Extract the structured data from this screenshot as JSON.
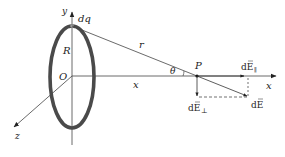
{
  "figure": {
    "colors": {
      "background": "#ffffff",
      "ring": "#4a4a4a",
      "lines": "#333333"
    },
    "labels": {
      "y_axis": "y",
      "x_axis": "x",
      "z_axis": "z",
      "origin": "O",
      "charge_element": "dq",
      "radius": "R",
      "distance_r": "r",
      "distance_x": "x",
      "angle": "θ",
      "point": "P",
      "dE_parallel": "dE",
      "dE_parallel_sub": "∥",
      "dE_perp": "dE",
      "dE_perp_sub": "⊥",
      "dE_total": "dE"
    }
  }
}
